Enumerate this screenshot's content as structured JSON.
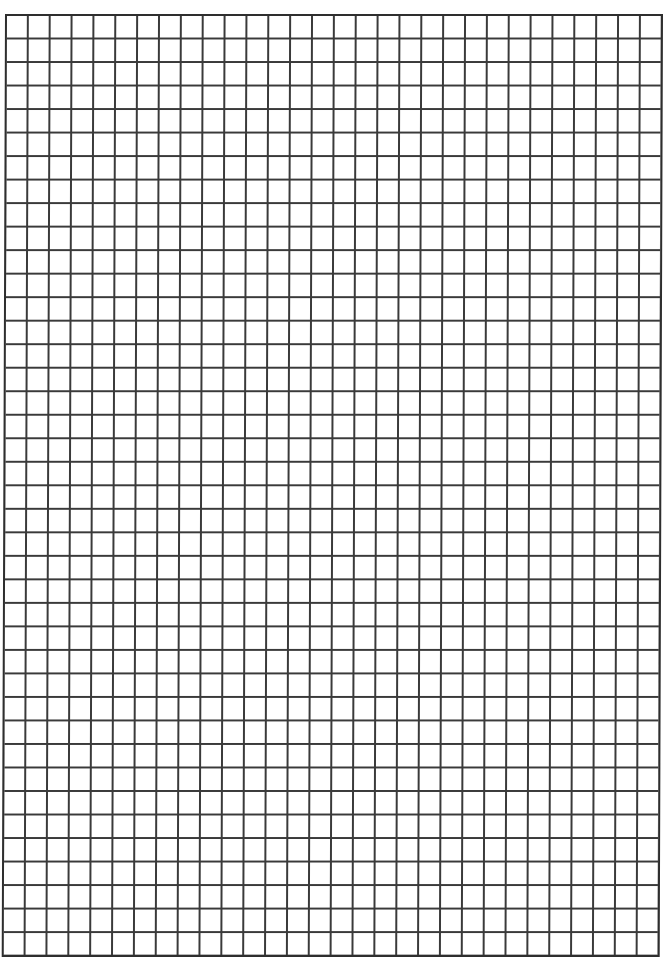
{
  "page": {
    "type": "graph-paper",
    "grid": {
      "columns": 30,
      "rows": 40,
      "line_color": "#3a3a3a",
      "border_color": "#2e2e2e",
      "background_color": "#ffffff"
    }
  }
}
